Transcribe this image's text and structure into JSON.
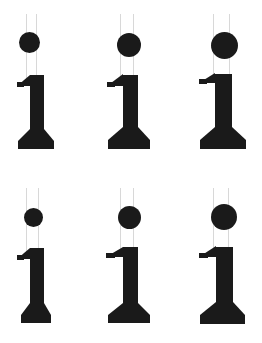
{
  "canvas": {
    "width": 262,
    "height": 343,
    "background_color": "#ffffff",
    "glyph_color": "#1a1a1a",
    "guide_line_color": "#d8d8d8"
  },
  "specimen": {
    "title": "Serif lowercase i specimen grid",
    "glyph_character": "i",
    "rows": 2,
    "columns": 3,
    "cell_width": 87,
    "cell_height": 171
  },
  "cells": [
    {
      "id": "cell-r1c1",
      "row": 1,
      "column": 1,
      "label": "i",
      "origin_x": 0,
      "origin_y": 0,
      "tittle": {
        "diameter": 21,
        "center_x": 29,
        "center_y": 42,
        "offset": "left"
      },
      "guides": {
        "left_x": 26,
        "right_x": 36,
        "top_y": 14,
        "bottom_y": 78
      },
      "stem": {
        "x": 30,
        "y": 75,
        "width": 14,
        "height": 72
      },
      "flag": {
        "x": 17,
        "y": 75,
        "width": 13,
        "height": 11
      },
      "foot": {
        "x": 18,
        "y": 141,
        "width": 36,
        "height": 8,
        "style": "wide"
      }
    },
    {
      "id": "cell-r1c2",
      "row": 1,
      "column": 2,
      "label": "i",
      "origin_x": 87,
      "origin_y": 0,
      "tittle": {
        "diameter": 24,
        "center_x": 42,
        "center_y": 45,
        "offset": "center"
      },
      "guides": {
        "left_x": 33,
        "right_x": 46,
        "top_y": 14,
        "bottom_y": 78
      },
      "stem": {
        "x": 36,
        "y": 75,
        "width": 15,
        "height": 72
      },
      "flag": {
        "x": 20,
        "y": 74,
        "width": 16,
        "height": 12
      },
      "foot": {
        "x": 21,
        "y": 140,
        "width": 42,
        "height": 9,
        "style": "wide"
      }
    },
    {
      "id": "cell-r1c3",
      "row": 1,
      "column": 3,
      "label": "i",
      "origin_x": 175,
      "origin_y": 0,
      "tittle": {
        "diameter": 27,
        "center_x": 49,
        "center_y": 45,
        "offset": "right"
      },
      "guides": {
        "left_x": 38,
        "right_x": 54,
        "top_y": 14,
        "bottom_y": 78
      },
      "stem": {
        "x": 40,
        "y": 74,
        "width": 17,
        "height": 73
      },
      "flag": {
        "x": 24,
        "y": 73,
        "width": 16,
        "height": 10
      },
      "foot": {
        "x": 25,
        "y": 140,
        "width": 46,
        "height": 9,
        "style": "wide"
      }
    },
    {
      "id": "cell-r2c1",
      "row": 2,
      "column": 1,
      "label": "i",
      "origin_x": 0,
      "origin_y": 172,
      "tittle": {
        "diameter": 19,
        "center_x": 33,
        "center_y": 45,
        "offset": "left"
      },
      "guides": {
        "left_x": 26,
        "right_x": 38,
        "top_y": 16,
        "bottom_y": 80
      },
      "stem": {
        "x": 30,
        "y": 76,
        "width": 14,
        "height": 74
      },
      "flag": {
        "x": 17,
        "y": 76,
        "width": 13,
        "height": 11
      },
      "foot": {
        "x": 21,
        "y": 143,
        "width": 30,
        "height": 8,
        "style": "narrow"
      }
    },
    {
      "id": "cell-r2c2",
      "row": 2,
      "column": 2,
      "label": "i",
      "origin_x": 87,
      "origin_y": 172,
      "tittle": {
        "diameter": 23,
        "center_x": 42,
        "center_y": 45,
        "offset": "center"
      },
      "guides": {
        "left_x": 33,
        "right_x": 46,
        "top_y": 16,
        "bottom_y": 79
      },
      "stem": {
        "x": 36,
        "y": 75,
        "width": 15,
        "height": 75
      },
      "flag": {
        "x": 19,
        "y": 75,
        "width": 17,
        "height": 10
      },
      "foot": {
        "x": 21,
        "y": 143,
        "width": 42,
        "height": 8,
        "style": "wide"
      }
    },
    {
      "id": "cell-r2c3",
      "row": 2,
      "column": 3,
      "label": "i",
      "origin_x": 175,
      "origin_y": 172,
      "tittle": {
        "diameter": 26,
        "center_x": 49,
        "center_y": 45,
        "offset": "right"
      },
      "guides": {
        "left_x": 38,
        "right_x": 53,
        "top_y": 16,
        "bottom_y": 79
      },
      "stem": {
        "x": 41,
        "y": 75,
        "width": 17,
        "height": 75
      },
      "flag": {
        "x": 24,
        "y": 74,
        "width": 17,
        "height": 11
      },
      "foot": {
        "x": 25,
        "y": 143,
        "width": 45,
        "height": 9,
        "style": "wide"
      }
    }
  ]
}
